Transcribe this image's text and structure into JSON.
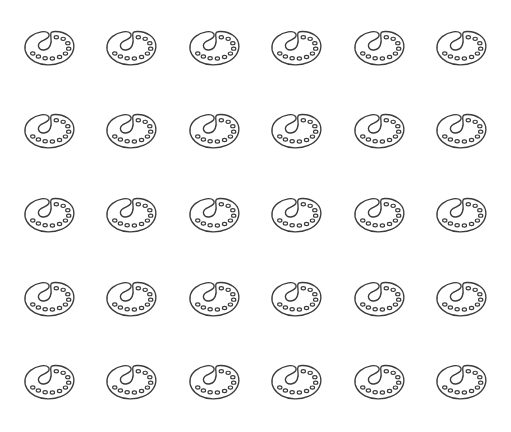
{
  "page": {
    "background_color": "#ffffff",
    "width": 511,
    "height": 432
  },
  "grid": {
    "columns": 6,
    "rows": 5,
    "total_items": 30,
    "item_name": "palette-icon",
    "item_label": "artist palette"
  },
  "icon": {
    "name": "palette-icon",
    "style": "line-art outline",
    "stroke_color": "#3b3b3d",
    "fill_color": "#ffffff",
    "well_count": 10,
    "has_thumb_hole": true
  },
  "items": [
    {
      "row": 1,
      "col": 1,
      "label": "artist palette"
    },
    {
      "row": 1,
      "col": 2,
      "label": "artist palette"
    },
    {
      "row": 1,
      "col": 3,
      "label": "artist palette"
    },
    {
      "row": 1,
      "col": 4,
      "label": "artist palette"
    },
    {
      "row": 1,
      "col": 5,
      "label": "artist palette"
    },
    {
      "row": 1,
      "col": 6,
      "label": "artist palette"
    },
    {
      "row": 2,
      "col": 1,
      "label": "artist palette"
    },
    {
      "row": 2,
      "col": 2,
      "label": "artist palette"
    },
    {
      "row": 2,
      "col": 3,
      "label": "artist palette"
    },
    {
      "row": 2,
      "col": 4,
      "label": "artist palette"
    },
    {
      "row": 2,
      "col": 5,
      "label": "artist palette"
    },
    {
      "row": 2,
      "col": 6,
      "label": "artist palette"
    },
    {
      "row": 3,
      "col": 1,
      "label": "artist palette"
    },
    {
      "row": 3,
      "col": 2,
      "label": "artist palette"
    },
    {
      "row": 3,
      "col": 3,
      "label": "artist palette"
    },
    {
      "row": 3,
      "col": 4,
      "label": "artist palette"
    },
    {
      "row": 3,
      "col": 5,
      "label": "artist palette"
    },
    {
      "row": 3,
      "col": 6,
      "label": "artist palette"
    },
    {
      "row": 4,
      "col": 1,
      "label": "artist palette"
    },
    {
      "row": 4,
      "col": 2,
      "label": "artist palette"
    },
    {
      "row": 4,
      "col": 3,
      "label": "artist palette"
    },
    {
      "row": 4,
      "col": 4,
      "label": "artist palette"
    },
    {
      "row": 4,
      "col": 5,
      "label": "artist palette"
    },
    {
      "row": 4,
      "col": 6,
      "label": "artist palette"
    },
    {
      "row": 5,
      "col": 1,
      "label": "artist palette"
    },
    {
      "row": 5,
      "col": 2,
      "label": "artist palette"
    },
    {
      "row": 5,
      "col": 3,
      "label": "artist palette"
    },
    {
      "row": 5,
      "col": 4,
      "label": "artist palette"
    },
    {
      "row": 5,
      "col": 5,
      "label": "artist palette"
    },
    {
      "row": 5,
      "col": 6,
      "label": "artist palette"
    }
  ]
}
